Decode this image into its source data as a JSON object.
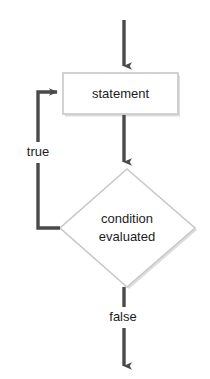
{
  "diagram": {
    "type": "flowchart",
    "canvas": {
      "width": 210,
      "height": 379,
      "background": "#ffffff"
    },
    "colors": {
      "arrow": "#4a4a4a",
      "node_stroke": "#c8c8c8",
      "node_fill": "#ffffff",
      "text": "#1c1c1c",
      "shadow": "#d8d8d8"
    },
    "nodes": {
      "statement": {
        "shape": "rectangle",
        "label": "statement",
        "x": 63,
        "y": 73,
        "width": 115,
        "height": 41
      },
      "condition": {
        "shape": "diamond",
        "label_line1": "condition",
        "label_line2": "evaluated",
        "center_x": 127,
        "center_y": 228,
        "half_width": 67,
        "half_height": 59
      }
    },
    "edges": [
      {
        "name": "entry-arrow",
        "from": "start",
        "to": "statement",
        "label": "",
        "direction": "down"
      },
      {
        "name": "statement-to-condition",
        "from": "statement",
        "to": "condition",
        "label": "",
        "direction": "down"
      },
      {
        "name": "condition-true-loopback",
        "from": "condition",
        "to": "statement",
        "label": "true",
        "direction": "left-up-right"
      },
      {
        "name": "condition-false-exit",
        "from": "condition",
        "to": "end",
        "label": "false",
        "direction": "down"
      }
    ],
    "labels": {
      "true": "true",
      "false": "false"
    }
  }
}
